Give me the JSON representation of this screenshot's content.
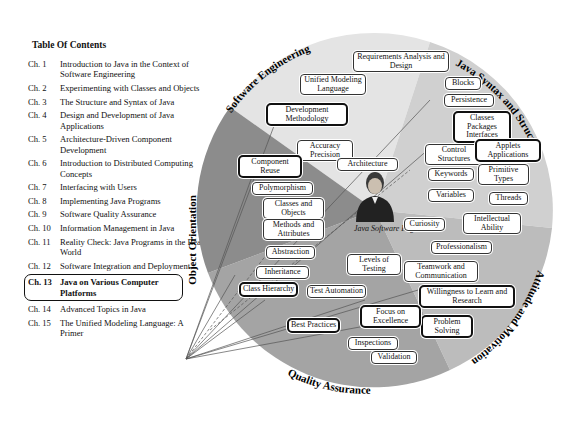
{
  "toc": {
    "title": "Table Of Contents",
    "items": [
      {
        "ch": "Ch. 1",
        "label": "Introduction to Java in the Context of Software Engineering"
      },
      {
        "ch": "Ch. 2",
        "label": "Experimenting with Classes and Objects"
      },
      {
        "ch": "Ch. 3",
        "label": "The Structure and Syntax of Java"
      },
      {
        "ch": "Ch. 4",
        "label": "Design and Development of Java Applications"
      },
      {
        "ch": "Ch. 5",
        "label": "Architecture-Driven Component Development"
      },
      {
        "ch": "Ch. 6",
        "label": "Introduction to Distributed Computing Concepts"
      },
      {
        "ch": "Ch. 7",
        "label": "Interfacing with Users"
      },
      {
        "ch": "Ch. 8",
        "label": "Implementing Java Programs"
      },
      {
        "ch": "Ch. 9",
        "label": "Software Quality Assurance"
      },
      {
        "ch": "Ch. 10",
        "label": "Information Management in Java"
      },
      {
        "ch": "Ch. 11",
        "label": "Reality Check: Java Programs in the Real World"
      },
      {
        "ch": "Ch. 12",
        "label": "Software Integration and Deployment"
      },
      {
        "ch": "Ch. 13",
        "label": "Java on Various Computer Platforms",
        "highlighted": true
      },
      {
        "ch": "Ch. 14",
        "label": "Advanced Topics in Java"
      },
      {
        "ch": "Ch. 15",
        "label": "The Unified Modeling Language: A Primer"
      }
    ]
  },
  "wheel": {
    "center_caption": "Java Software Engineer",
    "segments": [
      {
        "name": "Software Engineering",
        "color": "#e4e4e4"
      },
      {
        "name": "Java Syntax and Structure",
        "color": "#cfcfcf"
      },
      {
        "name": "Attitude and Motivation",
        "color": "#b9b9b9"
      },
      {
        "name": "Quality Assurance",
        "color": "#a2a2a2"
      },
      {
        "name": "Object Orientation",
        "color": "#8a8a8a"
      }
    ],
    "nodes": {
      "req": "Requirements Analysis and Design",
      "uml": "Unified Modeling Language",
      "devmeth": "Development Methodology",
      "accuracy": "Accuracy Precision",
      "architecture": "Architecture",
      "blocks": "Blocks",
      "persistence": "Persistence",
      "classes_pkg": "Classes Packages Interfaces",
      "control": "Control Structures",
      "applets": "Applets Applications",
      "keywords": "Keywords",
      "primitive": "Primitive Types",
      "variables": "Variables",
      "threads": "Threads",
      "component": "Component Reuse",
      "polymorphism": "Polymorphism",
      "classes_obj": "Classes and Objects",
      "methods": "Methods and Attributes",
      "abstraction": "Abstraction",
      "inheritance": "Inheritance",
      "class_hier": "Class Hierarchy",
      "curiosity": "Curiosity",
      "intellectual": "Intellectual Ability",
      "professionalism": "Professionalism",
      "teamwork": "Teamwork and Communication",
      "willingness": "Willingness to Learn and Research",
      "problem": "Problem Solving",
      "levels": "Levels of Testing",
      "test_auto": "Test Automation",
      "focus": "Focus on Excellence",
      "best": "Best Practices",
      "inspections": "Inspections",
      "validation": "Validation"
    }
  }
}
